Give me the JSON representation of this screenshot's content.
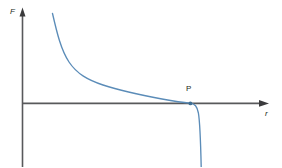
{
  "figure": {
    "kind": "line-plot",
    "background_color": "#ffffff",
    "axis_color": "#58595b",
    "curve_color": "#5b8cb8",
    "text_color": "#231f20",
    "y_axis": {
      "label": "F",
      "label_style": "italic",
      "arrow": "up-arrow-icon"
    },
    "x_axis": {
      "label": "r",
      "label_style": "italic",
      "arrow": "right-arrow-icon"
    },
    "annotations": [
      {
        "name": "point-P",
        "label": "P",
        "marker": "dot"
      }
    ]
  },
  "chart_data": {
    "type": "line",
    "title": "",
    "xlabel": "r",
    "ylabel": "F",
    "grid": false,
    "legend_position": "none",
    "xlim": [
      0,
      10
    ],
    "ylim": [
      -4.2,
      6.2
    ],
    "annotations": [
      {
        "label": "P",
        "x": 7.04,
        "y": 0,
        "note": "zero-crossing / equilibrium separation"
      }
    ],
    "series": [
      {
        "name": "F(r)",
        "color": "#5b8cb8",
        "x": [
          1.22,
          1.3,
          1.4,
          1.52,
          1.65,
          1.8,
          2.0,
          2.25,
          2.55,
          2.9,
          3.3,
          3.75,
          4.25,
          4.8,
          5.4,
          6.0,
          6.5,
          6.85,
          7.04,
          7.18,
          7.3,
          7.4,
          7.48,
          7.54,
          7.6
        ],
        "y": [
          5.95,
          5.3,
          4.55,
          3.8,
          3.2,
          2.7,
          2.2,
          1.78,
          1.42,
          1.15,
          0.93,
          0.75,
          0.6,
          0.46,
          0.33,
          0.21,
          0.12,
          0.04,
          0.0,
          -0.25,
          -0.7,
          -1.35,
          -2.15,
          -3.1,
          -4.1
        ]
      }
    ],
    "curve_path": "M 52.5,13.5 C 57,33 61,50 69,62 C 77,74 88,80 103,85 C 118,90 140,95 162,99 C 175,101.3 184,102.6 190,103.2 C 195,103.8 197,106 198.4,113 C 199.6,120 200.6,140 201.2,167"
  }
}
